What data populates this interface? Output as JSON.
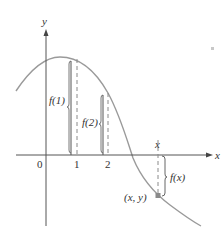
{
  "figure": {
    "axes": {
      "x_label": "x",
      "y_label": "y",
      "origin_label": "0",
      "ticks": [
        {
          "label": "1",
          "value": 1
        },
        {
          "label": "2",
          "value": 2
        }
      ]
    },
    "annotations": {
      "f1": "f(1)",
      "f2": "f(2)",
      "fx": "f(x)",
      "x_marker": "x",
      "point": "(x, y)"
    },
    "colors": {
      "curve": "#9a9a9a",
      "axis": "#555555",
      "bracket": "#555555",
      "dash": "#8a8a8a",
      "point": "#8a8a8a",
      "text": "#333333"
    }
  }
}
